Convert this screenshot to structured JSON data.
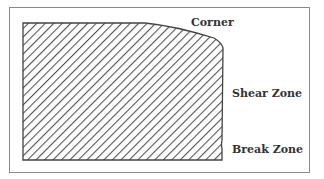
{
  "diagram": {
    "labels": {
      "corner": "Corner",
      "shear_zone": "Shear Zone",
      "break_zone": "Break Zone"
    },
    "colors": {
      "outline": "#444444",
      "hatch": "#555555",
      "frame": "#8a8a8a",
      "text": "#333333"
    }
  }
}
